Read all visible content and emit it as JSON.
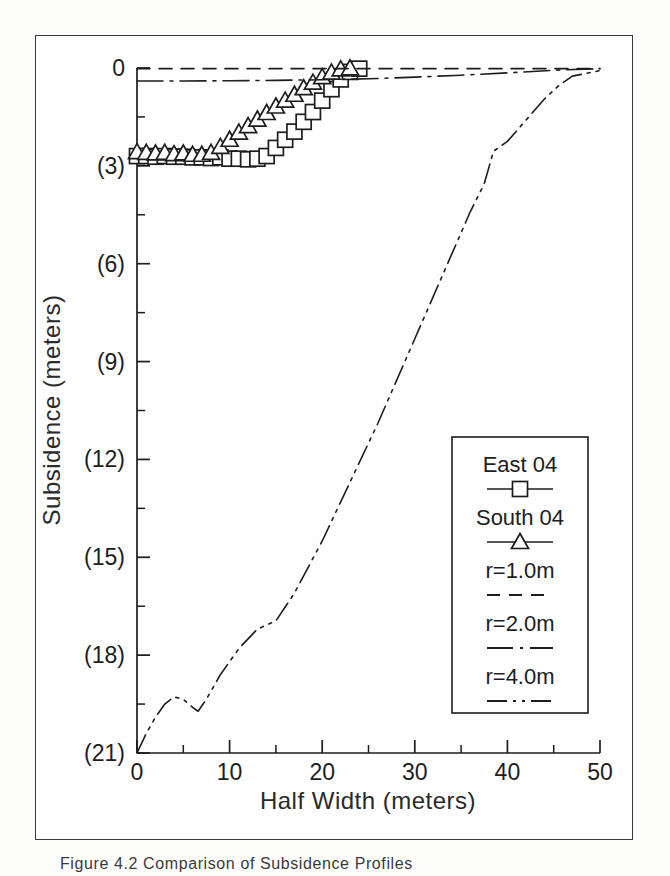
{
  "figure": {
    "caption": "Figure 4.2 Comparison of Subsidence Profiles"
  },
  "chart_data": {
    "type": "line",
    "title": "",
    "xlabel": "Half Width (meters)",
    "ylabel": "Subsidence (meters)",
    "xlim": [
      0,
      50
    ],
    "ylim": [
      -21,
      0
    ],
    "grid": false,
    "legend_position": "lower-right-inside",
    "x_ticks": [
      0,
      10,
      20,
      30,
      40,
      50
    ],
    "x_tick_labels": [
      "0",
      "10",
      "20",
      "30",
      "40",
      "50"
    ],
    "x_minor_ticks": [
      5,
      15,
      25,
      35,
      45
    ],
    "y_ticks": [
      0,
      -3,
      -6,
      -9,
      -12,
      -15,
      -18,
      -21
    ],
    "y_tick_labels": [
      "0",
      "(3)",
      "(6)",
      "(9)",
      "(12)",
      "(15)",
      "(18)",
      "(21)"
    ],
    "y_minor_ticks": [
      -1.5,
      -4.5,
      -7.5,
      -10.5,
      -13.5,
      -16.5,
      -19.5
    ],
    "series": [
      {
        "name": "East 04",
        "marker": "square",
        "line": "solid",
        "x": [
          0,
          1,
          2,
          3,
          4,
          5,
          6,
          7,
          8,
          9,
          10,
          11,
          12,
          13,
          14,
          15,
          16,
          17,
          18,
          19,
          20,
          21,
          22,
          23,
          24
        ],
        "y": [
          -2.7,
          -2.7,
          -2.72,
          -2.7,
          -2.72,
          -2.72,
          -2.74,
          -2.74,
          -2.76,
          -2.74,
          -2.78,
          -2.78,
          -2.8,
          -2.78,
          -2.7,
          -2.45,
          -2.2,
          -1.95,
          -1.65,
          -1.35,
          -1.0,
          -0.65,
          -0.35,
          -0.12,
          -0.02
        ]
      },
      {
        "name": "South 04",
        "marker": "triangle",
        "line": "solid",
        "x": [
          0,
          1,
          2,
          3,
          4,
          5,
          6,
          7,
          8,
          9,
          10,
          11,
          12,
          13,
          14,
          15,
          16,
          17,
          18,
          19,
          20,
          21,
          22,
          23
        ],
        "y": [
          -2.58,
          -2.6,
          -2.62,
          -2.6,
          -2.64,
          -2.62,
          -2.66,
          -2.66,
          -2.6,
          -2.42,
          -2.2,
          -1.98,
          -1.78,
          -1.58,
          -1.38,
          -1.18,
          -1.0,
          -0.82,
          -0.62,
          -0.45,
          -0.28,
          -0.14,
          -0.04,
          -0.01
        ]
      },
      {
        "name": "r=1.0m",
        "marker": "none",
        "line": "dashed",
        "x": [
          0,
          50
        ],
        "y": [
          -0.02,
          -0.02
        ]
      },
      {
        "name": "r=2.0m",
        "marker": "none",
        "line": "dashdot",
        "x": [
          0,
          5,
          10,
          15,
          20,
          25,
          30,
          35,
          40,
          45,
          50
        ],
        "y": [
          -0.4,
          -0.4,
          -0.39,
          -0.38,
          -0.36,
          -0.33,
          -0.28,
          -0.22,
          -0.15,
          -0.07,
          -0.02
        ]
      },
      {
        "name": "r=4.0m",
        "marker": "none",
        "line": "dashdotdot",
        "x": [
          0,
          1,
          2,
          3,
          4,
          5,
          6,
          6.6,
          7.5,
          9,
          11,
          13,
          15,
          17,
          18.5,
          20,
          22,
          24,
          26,
          28,
          30,
          32,
          34,
          36,
          37.5,
          38.5,
          40,
          42,
          44,
          45.5,
          47,
          50
        ],
        "y": [
          -21.0,
          -20.4,
          -19.9,
          -19.5,
          -19.28,
          -19.35,
          -19.6,
          -19.72,
          -19.35,
          -18.6,
          -17.8,
          -17.2,
          -16.95,
          -16.1,
          -15.3,
          -14.5,
          -13.3,
          -12.1,
          -10.9,
          -9.6,
          -8.3,
          -7.0,
          -5.7,
          -4.4,
          -3.55,
          -2.55,
          -2.25,
          -1.6,
          -0.95,
          -0.55,
          -0.25,
          -0.08
        ]
      }
    ],
    "legend_entries": [
      {
        "label": "East 04",
        "style": "line-square"
      },
      {
        "label": "South 04",
        "style": "line-triangle"
      },
      {
        "label": "r=1.0m",
        "style": "dashed"
      },
      {
        "label": "r=2.0m",
        "style": "dashdot"
      },
      {
        "label": "r=4.0m",
        "style": "dashdotdot"
      }
    ],
    "colors": {
      "ink": "#1d1d1d",
      "frame": "#3b3b3b",
      "background": "#fefefe"
    }
  }
}
